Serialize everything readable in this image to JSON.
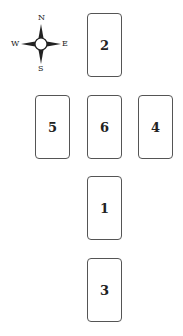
{
  "compass": {
    "north": "N",
    "south": "S",
    "east": "E",
    "west": "W"
  },
  "cards": [
    {
      "id": "2",
      "label": "2",
      "position": "top"
    },
    {
      "id": "5",
      "label": "5",
      "position": "west"
    },
    {
      "id": "6",
      "label": "6",
      "position": "center"
    },
    {
      "id": "4",
      "label": "4",
      "position": "east"
    },
    {
      "id": "1",
      "label": "1",
      "position": "south"
    },
    {
      "id": "3",
      "label": "3",
      "position": "bottom"
    }
  ]
}
